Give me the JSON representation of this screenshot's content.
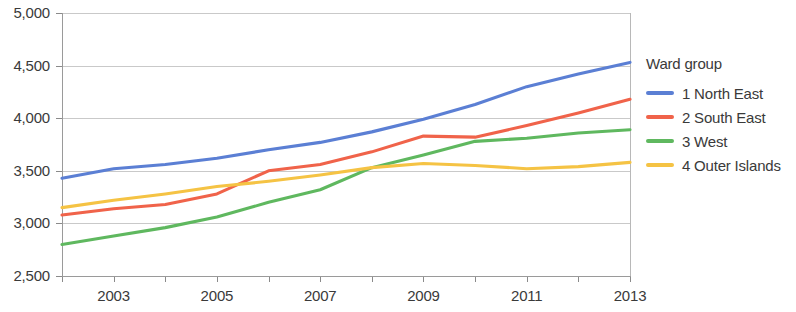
{
  "chart_data": {
    "type": "line",
    "title": "",
    "xlabel": "",
    "ylabel": "",
    "xlim": [
      2002,
      2013
    ],
    "ylim": [
      2500,
      5000
    ],
    "grid": true,
    "legend_position": "right",
    "legend_title": "Ward group",
    "x": [
      2002,
      2003,
      2004,
      2005,
      2006,
      2007,
      2008,
      2009,
      2010,
      2011,
      2012,
      2013
    ],
    "y_ticks": [
      2500,
      3000,
      3500,
      4000,
      4500,
      5000
    ],
    "y_tick_labels": [
      "2,500",
      "3,000",
      "3,500",
      "4,000",
      "4,500",
      "5,000"
    ],
    "x_ticks": [
      2002,
      2003,
      2004,
      2005,
      2006,
      2007,
      2008,
      2009,
      2010,
      2011,
      2012,
      2013
    ],
    "x_tick_labels": [
      "",
      "2003",
      "",
      "2005",
      "",
      "2007",
      "",
      "2009",
      "",
      "2011",
      "",
      "2013"
    ],
    "series": [
      {
        "name": "1 North East",
        "color": "#5b7fd4",
        "values": [
          3430,
          3520,
          3560,
          3620,
          3700,
          3770,
          3870,
          3990,
          4130,
          4300,
          4420,
          4530
        ]
      },
      {
        "name": "2 South East",
        "color": "#f0634a",
        "values": [
          3080,
          3140,
          3180,
          3280,
          3500,
          3560,
          3680,
          3830,
          3820,
          3930,
          4050,
          4180
        ]
      },
      {
        "name": "3 West",
        "color": "#5fb85f",
        "values": [
          2800,
          2880,
          2960,
          3060,
          3200,
          3320,
          3530,
          3650,
          3780,
          3810,
          3860,
          3890
        ]
      },
      {
        "name": "4 Outer Islands",
        "color": "#f5c344",
        "values": [
          3150,
          3220,
          3280,
          3350,
          3400,
          3460,
          3530,
          3570,
          3550,
          3520,
          3540,
          3580
        ]
      }
    ]
  },
  "legend": {
    "title": "Ward group",
    "items": [
      {
        "label": "1 North East",
        "color": "#5b7fd4"
      },
      {
        "label": "2 South East",
        "color": "#f0634a"
      },
      {
        "label": "3 West",
        "color": "#5fb85f"
      },
      {
        "label": "4 Outer Islands",
        "color": "#f5c344"
      }
    ]
  }
}
